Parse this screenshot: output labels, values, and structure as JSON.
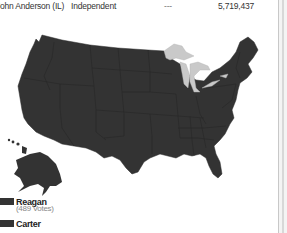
{
  "results_table": {
    "rows": [
      {
        "candidate": "John Anderson (IL)",
        "party": "Independent",
        "electoral_votes": "---",
        "popular_votes": "5,719,437"
      }
    ]
  },
  "map": {
    "title": "US 1980 Presidential Election Map",
    "fill_color": "#333333",
    "lakes_color": "#cccccc"
  },
  "legend": {
    "items": [
      {
        "label": "Reagan",
        "sublabel": "(489 Votes)",
        "color": "#333333"
      },
      {
        "label": "Carter",
        "color": "#333333"
      }
    ]
  },
  "colors": {
    "map_fill": "#333333",
    "state_border": "#252525",
    "great_lakes": "#c9c9c9",
    "background": "#ffffff"
  }
}
